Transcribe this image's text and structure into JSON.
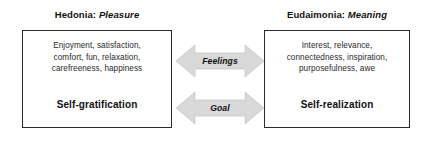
{
  "columns": [
    {
      "heading_term": "Hedonia:",
      "heading_gloss": "Pleasure",
      "attribute_lines": [
        "Enjoyment, satisfaction,",
        "comfort, fun, relaxation,",
        "carefreeness, happiness"
      ],
      "outcome": "Self-gratification"
    },
    {
      "heading_term": "Eudaimonia:",
      "heading_gloss": "Meaning",
      "attribute_lines": [
        "Interest, relevance,",
        "connectedness, inspiration,",
        "purposefulness, awe"
      ],
      "outcome": "Self-realization"
    }
  ],
  "connectors": [
    {
      "label": "Feelings",
      "icon": "double-headed-arrow-icon"
    },
    {
      "label": "Goal",
      "icon": "double-headed-arrow-icon"
    }
  ],
  "colors": {
    "arrow_fill": "#d8d8d8",
    "arrow_stroke": "#c2c2c2",
    "box_border": "#2b2b2b",
    "text": "#1a1a1a",
    "background": "#ffffff"
  }
}
